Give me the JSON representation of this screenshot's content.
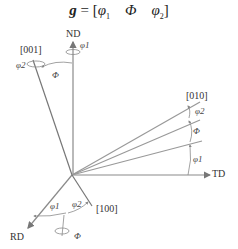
{
  "title": {
    "g": "g",
    "eq": " = [",
    "phi1": "φ",
    "sub1": "1",
    "Phi": "Φ",
    "phi2": "φ",
    "sub2": "2",
    "close": "]"
  },
  "axes": {
    "nd": "ND",
    "td": "TD",
    "rd": "RD"
  },
  "crystal": {
    "c001": "[001]",
    "c010": "[010]",
    "c100": "[100]"
  },
  "angles": {
    "nd_phi1": "φ1",
    "nd_phi2": "φ2",
    "nd_Phi": "Φ",
    "td_phi2": "φ2",
    "td_Phi": "Φ",
    "td_phi1": "φ1",
    "rd_phi1": "φ1",
    "rd_phi2": "φ2",
    "rd_Phi": "Φ"
  },
  "colors": {
    "line": "#888888",
    "text": "#222222"
  }
}
